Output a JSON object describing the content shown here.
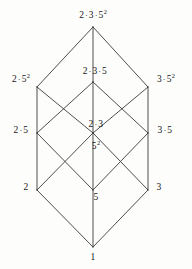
{
  "figure": {
    "kind": "hasse-diagram",
    "background_color": "#fdfdfc",
    "line_color": "#3a3a3a",
    "text_color": "#161616",
    "width": 192,
    "height": 269
  },
  "nodes": [
    {
      "id": "top",
      "label": "2 · 3 · 5²",
      "parts": [
        "2",
        "3",
        "5"
      ],
      "exponents": [
        "",
        "",
        "2"
      ],
      "x": 93,
      "y": 27,
      "label_x": 93,
      "label_y": 16,
      "rank": 4
    },
    {
      "id": "2_5_2",
      "label": "2 · 5²",
      "parts": [
        "2",
        "5"
      ],
      "exponents": [
        "",
        "2"
      ],
      "x": 37,
      "y": 87,
      "label_x": 21,
      "label_y": 80,
      "rank": 3
    },
    {
      "id": "2_3_5",
      "label": "2 · 3 · 5",
      "parts": [
        "2",
        "3",
        "5"
      ],
      "exponents": [
        "",
        "",
        ""
      ],
      "x": 93,
      "y": 82,
      "label_x": 95,
      "label_y": 72,
      "rank": 3
    },
    {
      "id": "3_5_2",
      "label": "3 · 5²",
      "parts": [
        "3",
        "5"
      ],
      "exponents": [
        "",
        "2"
      ],
      "x": 148,
      "y": 87,
      "label_x": 166,
      "label_y": 80,
      "rank": 3
    },
    {
      "id": "2_5",
      "label": "2 · 5",
      "parts": [
        "2",
        "5"
      ],
      "exponents": [
        "",
        ""
      ],
      "x": 37,
      "y": 133,
      "label_x": 21,
      "label_y": 131,
      "rank": 2
    },
    {
      "id": "2_3",
      "label": "2 · 3",
      "parts": [
        "2",
        "3"
      ],
      "exponents": [
        "",
        ""
      ],
      "x": 93,
      "y": 133,
      "label_x": 96,
      "label_y": 125,
      "rank": 2
    },
    {
      "id": "5_2",
      "label": "5²",
      "parts": [
        "5"
      ],
      "exponents": [
        "2"
      ],
      "x": 93,
      "y": 133,
      "label_x": 96,
      "label_y": 147,
      "rank": 2
    },
    {
      "id": "3_5",
      "label": "3 · 5",
      "parts": [
        "3",
        "5"
      ],
      "exponents": [
        "",
        ""
      ],
      "x": 148,
      "y": 133,
      "label_x": 165,
      "label_y": 131,
      "rank": 2
    },
    {
      "id": "2",
      "label": "2",
      "parts": [
        "2"
      ],
      "exponents": [
        ""
      ],
      "x": 37,
      "y": 190,
      "label_x": 26,
      "label_y": 188,
      "rank": 1
    },
    {
      "id": "5",
      "label": "5",
      "parts": [
        "5"
      ],
      "exponents": [
        ""
      ],
      "x": 93,
      "y": 190,
      "label_x": 96,
      "label_y": 198,
      "rank": 1
    },
    {
      "id": "3",
      "label": "3",
      "parts": [
        "3"
      ],
      "exponents": [
        ""
      ],
      "x": 148,
      "y": 190,
      "label_x": 159,
      "label_y": 188,
      "rank": 1
    },
    {
      "id": "one",
      "label": "1",
      "parts": [
        "1"
      ],
      "exponents": [
        ""
      ],
      "x": 93,
      "y": 247,
      "label_x": 93,
      "label_y": 258,
      "rank": 0
    }
  ],
  "edges": [
    {
      "from": "top",
      "to": "2_5_2"
    },
    {
      "from": "top",
      "to": "2_3_5"
    },
    {
      "from": "top",
      "to": "3_5_2"
    },
    {
      "from": "2_5_2",
      "to": "2_5"
    },
    {
      "from": "2_5_2",
      "to": "5_2"
    },
    {
      "from": "2_3_5",
      "to": "2_5"
    },
    {
      "from": "2_3_5",
      "to": "2_3"
    },
    {
      "from": "2_3_5",
      "to": "3_5"
    },
    {
      "from": "3_5_2",
      "to": "3_5"
    },
    {
      "from": "3_5_2",
      "to": "5_2"
    },
    {
      "from": "2_5",
      "to": "2"
    },
    {
      "from": "2_5",
      "to": "5"
    },
    {
      "from": "2_3",
      "to": "2"
    },
    {
      "from": "2_3",
      "to": "3"
    },
    {
      "from": "5_2",
      "to": "5"
    },
    {
      "from": "3_5",
      "to": "3"
    },
    {
      "from": "3_5",
      "to": "5"
    },
    {
      "from": "2",
      "to": "one"
    },
    {
      "from": "5",
      "to": "one"
    },
    {
      "from": "3",
      "to": "one"
    }
  ]
}
